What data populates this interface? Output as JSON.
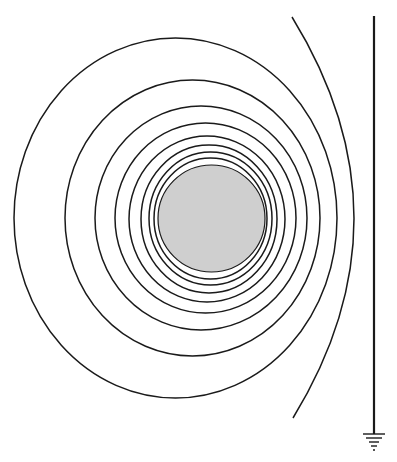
{
  "diagram": {
    "title": "",
    "colors": {
      "background": "#ffffff",
      "stroke": "#1a1a1a",
      "sphere_fill": "#cfcfcf"
    },
    "sphere": {
      "cx": 211.5,
      "cy": 218.5,
      "r": 53.5
    },
    "contours": [
      {
        "cx": 210.5,
        "cy": 218.5,
        "rx": 56.5,
        "ry": 60.5
      },
      {
        "cx": 210.5,
        "cy": 218.5,
        "rx": 61.5,
        "ry": 66.5
      },
      {
        "cx": 209,
        "cy": 219,
        "rx": 68,
        "ry": 74
      },
      {
        "cx": 207,
        "cy": 219,
        "rx": 78,
        "ry": 83
      },
      {
        "cx": 205.5,
        "cy": 218,
        "rx": 90.5,
        "ry": 95
      },
      {
        "cx": 201,
        "cy": 218,
        "rx": 106,
        "ry": 112
      },
      {
        "cx": 192.5,
        "cy": 218,
        "rx": 127.5,
        "ry": 138
      },
      {
        "cx": 175.5,
        "cy": 218,
        "rx": 161.5,
        "ry": 180
      }
    ],
    "open_arc": {
      "start": [
        292,
        17
      ],
      "apex": [
        354,
        218
      ],
      "end": [
        293,
        418
      ]
    },
    "plane": {
      "x": 374,
      "y_top": 16,
      "y_bottom": 434
    },
    "ground_symbol": {
      "x": 374,
      "bars": [
        {
          "y": 434,
          "half_width": 11
        },
        {
          "y": 438,
          "half_width": 8
        },
        {
          "y": 442,
          "half_width": 5
        },
        {
          "y": 446,
          "half_width": 3
        }
      ],
      "dot_y": 450
    }
  }
}
